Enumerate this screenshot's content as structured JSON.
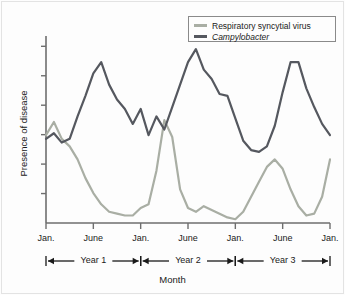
{
  "figure": {
    "background_color": "#fdfdfd",
    "border_color": "#e3e3e3"
  },
  "legend": {
    "position": "top-right",
    "border_color": "#8a8a8a",
    "entries": [
      {
        "label": "Respiratory syncytial virus",
        "color": "#a9aea4",
        "italic": false
      },
      {
        "label": "Campylobacter",
        "color": "#55585f",
        "italic": true
      }
    ]
  },
  "axes": {
    "ylabel": "Presence of disease",
    "xlabel": "Month",
    "y_tick_count": 6,
    "x_tick_labels": [
      "Jan.",
      "June",
      "Jan.",
      "June",
      "Jan.",
      "June",
      "Jan."
    ]
  },
  "year_brackets": [
    {
      "label": "Year 1"
    },
    {
      "label": "Year 2"
    },
    {
      "label": "Year 3"
    }
  ],
  "chart_data": {
    "type": "line",
    "title": "",
    "xlabel": "Month",
    "ylabel": "Presence of disease",
    "xlim": [
      0,
      36
    ],
    "ylim": [
      0,
      100
    ],
    "grid": false,
    "legend_position": "top-right",
    "x_tick_positions": [
      0,
      6,
      12,
      18,
      24,
      30,
      36
    ],
    "x_tick_labels": [
      "Jan.",
      "June",
      "Jan.",
      "June",
      "Jan.",
      "June",
      "Jan."
    ],
    "annotations": [
      "Year 1",
      "Year 2",
      "Year 3"
    ],
    "x": [
      0,
      1,
      2,
      3,
      4,
      5,
      6,
      7,
      8,
      9,
      10,
      11,
      12,
      13,
      14,
      15,
      16,
      17,
      18,
      19,
      20,
      21,
      22,
      23,
      24,
      25,
      26,
      27,
      28,
      29,
      30,
      31,
      32,
      33,
      34,
      35,
      36
    ],
    "series": [
      {
        "name": "Respiratory syncytial virus",
        "color": "#a9aea4",
        "values": [
          47,
          54,
          45,
          41,
          34,
          24,
          16,
          10,
          6,
          5,
          4,
          4,
          8,
          10,
          28,
          55,
          46,
          18,
          8,
          6,
          9,
          7,
          5,
          3,
          2,
          6,
          14,
          22,
          30,
          34,
          29,
          18,
          9,
          4,
          5,
          14,
          34
        ]
      },
      {
        "name": "Campylobacter",
        "color": "#55585f",
        "values": [
          45,
          48,
          43,
          45,
          57,
          68,
          80,
          86,
          74,
          66,
          61,
          53,
          61,
          47,
          57,
          50,
          62,
          74,
          86,
          93,
          82,
          77,
          69,
          68,
          56,
          44,
          39,
          38,
          41,
          52,
          70,
          86,
          86,
          72,
          62,
          53,
          47
        ]
      }
    ]
  }
}
